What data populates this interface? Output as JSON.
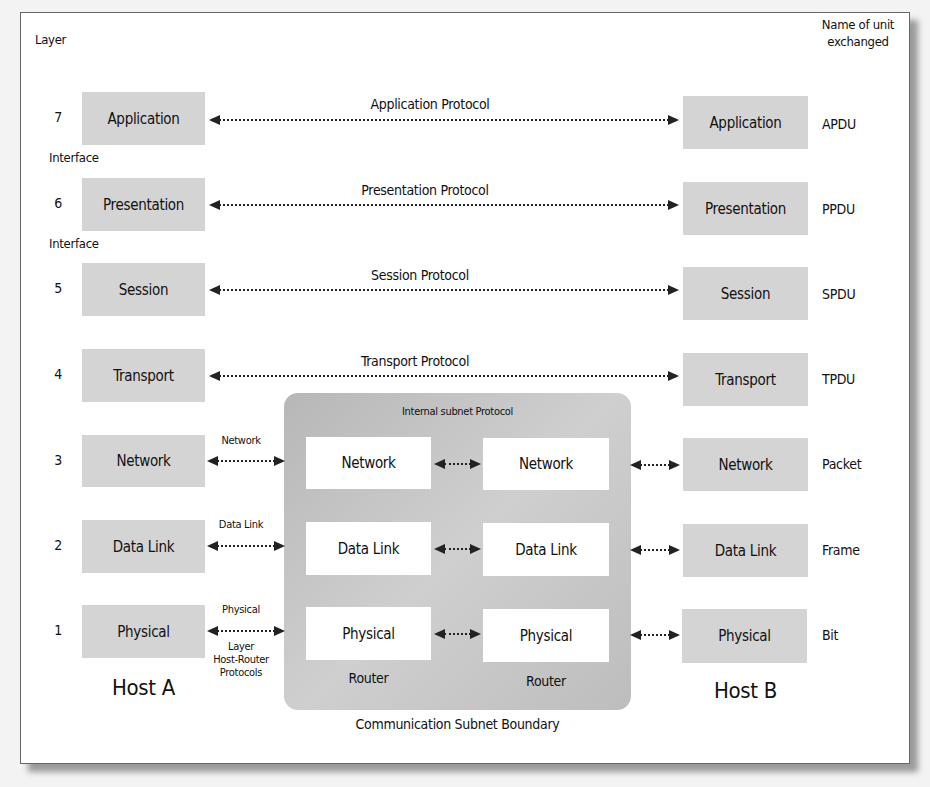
{
  "headers": {
    "layer": "Layer",
    "unit_name": "Name of unit\nexchanged",
    "unit_name_line1": "Name of unit",
    "unit_name_line2": "exchanged"
  },
  "interfaces": [
    "Interface",
    "Interface"
  ],
  "layers": [
    {
      "number": "7",
      "name": "Application",
      "protocol": "Application Protocol",
      "unit": "APDU"
    },
    {
      "number": "6",
      "name": "Presentation",
      "protocol": "Presentation Protocol",
      "unit": "PPDU"
    },
    {
      "number": "5",
      "name": "Session",
      "protocol": "Session Protocol",
      "unit": "SPDU"
    },
    {
      "number": "4",
      "name": "Transport",
      "protocol": "Transport Protocol",
      "unit": "TPDU"
    },
    {
      "number": "3",
      "name": "Network",
      "protocol": "Network",
      "unit": "Packet"
    },
    {
      "number": "2",
      "name": "Data Link",
      "protocol": "Data Link",
      "unit": "Frame"
    },
    {
      "number": "1",
      "name": "Physical",
      "protocol": "Physical",
      "unit": "Bit"
    }
  ],
  "host_router_protocols": {
    "line1": "Layer",
    "line2": "Host-Router",
    "line3": "Protocols"
  },
  "subnet": {
    "title": "Internal subnet Protocol",
    "boundary_label": "Communication Subnet Boundary",
    "routers": [
      {
        "label": "Router",
        "layers": [
          "Network",
          "Data Link",
          "Physical"
        ]
      },
      {
        "label": "Router",
        "layers": [
          "Network",
          "Data Link",
          "Physical"
        ]
      }
    ]
  },
  "hosts": {
    "a": "Host A",
    "b": "Host B"
  },
  "colors": {
    "host_box": "#d4d4d4",
    "subnet_bg": "#c2c2c2",
    "router_box": "#ffffff",
    "arrow": "#222222"
  }
}
